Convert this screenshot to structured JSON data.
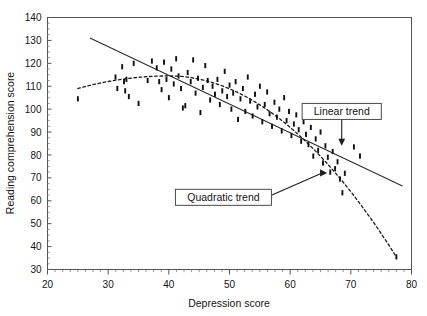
{
  "chart_data": {
    "type": "scatter",
    "title": "",
    "xlabel": "Depression score",
    "ylabel": "Reading comprehension score",
    "xlim": [
      20,
      80
    ],
    "ylim": [
      30,
      140
    ],
    "xticks": [
      20,
      30,
      40,
      50,
      60,
      70,
      80
    ],
    "yticks": [
      30,
      40,
      50,
      60,
      70,
      80,
      90,
      100,
      110,
      120,
      130,
      140
    ],
    "grid": false,
    "legend": "none",
    "marker_color": "#101010",
    "points": [
      [
        25.0,
        104.5
      ],
      [
        31.2,
        114.0
      ],
      [
        31.5,
        109.0
      ],
      [
        32.3,
        118.5
      ],
      [
        32.6,
        112.0
      ],
      [
        32.8,
        108.0
      ],
      [
        33.0,
        113.0
      ],
      [
        33.4,
        105.5
      ],
      [
        34.2,
        120.0
      ],
      [
        35.0,
        102.5
      ],
      [
        36.5,
        112.5
      ],
      [
        37.2,
        121.0
      ],
      [
        38.0,
        118.0
      ],
      [
        38.4,
        112.0
      ],
      [
        38.8,
        108.5
      ],
      [
        39.2,
        120.5
      ],
      [
        39.6,
        113.0
      ],
      [
        40.0,
        105.0
      ],
      [
        40.4,
        117.5
      ],
      [
        40.8,
        111.0
      ],
      [
        41.2,
        122.0
      ],
      [
        41.6,
        114.5
      ],
      [
        42.0,
        109.0
      ],
      [
        42.3,
        100.5
      ],
      [
        42.7,
        101.5
      ],
      [
        43.1,
        116.0
      ],
      [
        43.6,
        112.0
      ],
      [
        44.0,
        121.5
      ],
      [
        44.4,
        107.0
      ],
      [
        44.8,
        113.5
      ],
      [
        45.2,
        98.5
      ],
      [
        45.6,
        109.5
      ],
      [
        46.0,
        119.0
      ],
      [
        46.4,
        112.5
      ],
      [
        46.8,
        104.0
      ],
      [
        47.2,
        110.0
      ],
      [
        47.6,
        106.5
      ],
      [
        48.0,
        113.0
      ],
      [
        48.4,
        102.0
      ],
      [
        48.8,
        108.0
      ],
      [
        49.2,
        116.5
      ],
      [
        49.6,
        105.5
      ],
      [
        50.0,
        110.5
      ],
      [
        50.3,
        100.0
      ],
      [
        50.6,
        107.0
      ],
      [
        51.0,
        112.0
      ],
      [
        51.4,
        95.5
      ],
      [
        51.8,
        104.5
      ],
      [
        52.2,
        109.0
      ],
      [
        52.6,
        99.0
      ],
      [
        53.0,
        114.0
      ],
      [
        53.4,
        103.5
      ],
      [
        53.8,
        97.0
      ],
      [
        54.2,
        106.5
      ],
      [
        54.6,
        101.0
      ],
      [
        55.0,
        110.0
      ],
      [
        55.4,
        94.5
      ],
      [
        55.8,
        102.0
      ],
      [
        56.2,
        107.5
      ],
      [
        56.6,
        98.0
      ],
      [
        57.0,
        92.5
      ],
      [
        57.4,
        103.0
      ],
      [
        57.8,
        96.5
      ],
      [
        58.2,
        100.0
      ],
      [
        58.6,
        90.5
      ],
      [
        59.0,
        105.0
      ],
      [
        59.4,
        95.0
      ],
      [
        59.8,
        99.0
      ],
      [
        60.2,
        88.5
      ],
      [
        60.6,
        93.5
      ],
      [
        61.0,
        97.5
      ],
      [
        61.4,
        91.0
      ],
      [
        61.8,
        86.0
      ],
      [
        62.2,
        94.5
      ],
      [
        62.6,
        89.0
      ],
      [
        63.0,
        84.5
      ],
      [
        63.4,
        92.0
      ],
      [
        63.8,
        79.5
      ],
      [
        64.2,
        87.0
      ],
      [
        64.6,
        82.0
      ],
      [
        65.0,
        90.0
      ],
      [
        65.4,
        76.5
      ],
      [
        65.8,
        84.0
      ],
      [
        66.2,
        79.0
      ],
      [
        66.6,
        72.5
      ],
      [
        67.0,
        81.5
      ],
      [
        67.4,
        74.0
      ],
      [
        67.8,
        77.0
      ],
      [
        68.2,
        69.5
      ],
      [
        68.6,
        63.5
      ],
      [
        69.0,
        72.0
      ],
      [
        70.5,
        83.5
      ],
      [
        71.5,
        79.5
      ],
      [
        77.5,
        35.5
      ]
    ],
    "trends": [
      {
        "name": "Linear trend",
        "style": "solid",
        "x_start": 27.0,
        "y_start": 131.0,
        "x_end": 78.5,
        "y_end": 66.5
      },
      {
        "name": "Quadratic trend",
        "style": "dashed",
        "x_start": 25.0,
        "y_start": 109.0,
        "x_vertex": 40.0,
        "y_vertex": 114.5,
        "x_end": 77.5,
        "y_end": 35.5
      }
    ],
    "annotations": [
      {
        "id": "linear-trend-callout",
        "label": "Linear trend",
        "box_x": 68.5,
        "box_y": 99.0,
        "target_x": 68.5,
        "target_y": 84.5,
        "leader": "vertical-down"
      },
      {
        "id": "quadratic-trend-callout",
        "label": "Quadratic trend",
        "box_x": 49.0,
        "box_y": 61.5,
        "target_x": 66.0,
        "target_y": 72.0,
        "leader": "horizontal-right"
      }
    ]
  }
}
